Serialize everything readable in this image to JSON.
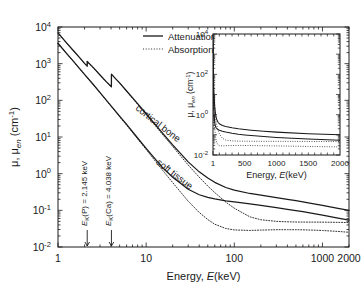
{
  "figure": {
    "background": "#ffffff",
    "line_color": "#1a1a1a"
  },
  "chart_data": {
    "type": "line",
    "title": "",
    "xlabel_prefix": "Energy, ",
    "xlabel_italic": "E",
    "xlabel_suffix": "(keV)",
    "ylabel": "μ, μ_en (cm⁻¹)",
    "xscale": "log",
    "yscale": "log",
    "xlim": [
      1,
      2000
    ],
    "ylim": [
      0.01,
      10000
    ],
    "xticks": [
      1,
      10,
      100,
      1000,
      2000
    ],
    "xticklabels": [
      "1",
      "10",
      "100",
      "1000",
      "2000"
    ],
    "yticks": [
      0.01,
      0.1,
      1,
      10,
      100,
      1000,
      10000
    ],
    "yticklabels": [
      "10⁻²",
      "10⁻¹",
      "10⁰",
      "10¹",
      "10²",
      "10³",
      "10⁴"
    ],
    "grid": false,
    "legend_position": "upper right",
    "legend": [
      {
        "label_prefix": "Attenuation, ",
        "symbol": "μ",
        "sub": "",
        "style": "solid"
      },
      {
        "label_prefix": "Absorption, ",
        "symbol": "μ",
        "sub": "en",
        "style": "dotted"
      }
    ],
    "annotations": [
      {
        "name": "k-edge-phosphorus",
        "text_prefix": "E",
        "text_sub": "K",
        "text_mid": "(P) = 2.145 ",
        "text_unit": "keV",
        "energy_keV": 2.145,
        "rotation": -90
      },
      {
        "name": "k-edge-calcium",
        "text_prefix": "E",
        "text_sub": "K",
        "text_mid": "(Ca) = 4.038 ",
        "text_unit": "keV",
        "energy_keV": 4.038,
        "rotation": -90
      }
    ],
    "curve_labels": [
      {
        "name": "cortical-bone",
        "text": "cortical bone",
        "rotation": 38
      },
      {
        "name": "soft-tissue",
        "text": "soft tissue",
        "rotation": 38
      }
    ],
    "series": [
      {
        "name": "cortical-bone-attenuation",
        "material": "cortical bone",
        "quantity": "attenuation",
        "style": "solid",
        "points": [
          [
            1.0,
            6900
          ],
          [
            1.25,
            3700
          ],
          [
            1.5,
            2250
          ],
          [
            1.75,
            1480
          ],
          [
            2.0,
            1020
          ],
          [
            2.144,
            860
          ],
          [
            2.146,
            1150
          ],
          [
            2.5,
            790
          ],
          [
            3.0,
            490
          ],
          [
            3.5,
            330
          ],
          [
            4.037,
            235
          ],
          [
            4.039,
            520
          ],
          [
            4.5,
            390
          ],
          [
            5.0,
            300
          ],
          [
            6.0,
            180
          ],
          [
            8.0,
            81
          ],
          [
            10.0,
            43
          ],
          [
            15.0,
            13.5
          ],
          [
            20.0,
            6.1
          ],
          [
            30.0,
            2.1
          ],
          [
            40.0,
            1.12
          ],
          [
            50.0,
            0.76
          ],
          [
            60.0,
            0.58
          ],
          [
            80.0,
            0.42
          ],
          [
            100.0,
            0.355
          ],
          [
            150.0,
            0.288
          ],
          [
            200.0,
            0.258
          ],
          [
            300.0,
            0.222
          ],
          [
            400.0,
            0.199
          ],
          [
            500.0,
            0.183
          ],
          [
            600.0,
            0.17
          ],
          [
            800.0,
            0.15
          ],
          [
            1000.0,
            0.136
          ],
          [
            1500.0,
            0.113
          ],
          [
            2000.0,
            0.1
          ]
        ]
      },
      {
        "name": "soft-tissue-attenuation",
        "material": "soft tissue",
        "quantity": "attenuation",
        "style": "solid",
        "points": [
          [
            1.0,
            3600
          ],
          [
            1.25,
            1900
          ],
          [
            1.5,
            1150
          ],
          [
            1.75,
            740
          ],
          [
            2.0,
            510
          ],
          [
            2.5,
            275
          ],
          [
            3.0,
            163
          ],
          [
            4.0,
            71
          ],
          [
            5.0,
            37
          ],
          [
            6.0,
            22
          ],
          [
            8.0,
            9.4
          ],
          [
            10.0,
            4.9
          ],
          [
            15.0,
            1.55
          ],
          [
            20.0,
            0.8
          ],
          [
            30.0,
            0.375
          ],
          [
            40.0,
            0.266
          ],
          [
            50.0,
            0.226
          ],
          [
            60.0,
            0.205
          ],
          [
            80.0,
            0.182
          ],
          [
            100.0,
            0.17
          ],
          [
            150.0,
            0.15
          ],
          [
            200.0,
            0.137
          ],
          [
            300.0,
            0.119
          ],
          [
            400.0,
            0.107
          ],
          [
            500.0,
            0.0985
          ],
          [
            600.0,
            0.092
          ],
          [
            800.0,
            0.0819
          ],
          [
            1000.0,
            0.0744
          ],
          [
            1500.0,
            0.0617
          ],
          [
            2000.0,
            0.0541
          ]
        ]
      },
      {
        "name": "cortical-bone-absorption",
        "material": "cortical bone",
        "quantity": "absorption",
        "style": "dotted",
        "points": [
          [
            1.0,
            6800
          ],
          [
            1.25,
            3650
          ],
          [
            1.5,
            2220
          ],
          [
            1.75,
            1460
          ],
          [
            2.0,
            1005
          ],
          [
            2.144,
            848
          ],
          [
            2.146,
            1135
          ],
          [
            2.5,
            780
          ],
          [
            3.0,
            482
          ],
          [
            3.5,
            325
          ],
          [
            4.037,
            230
          ],
          [
            4.039,
            512
          ],
          [
            4.5,
            383
          ],
          [
            5.0,
            294
          ],
          [
            6.0,
            176
          ],
          [
            8.0,
            78
          ],
          [
            10.0,
            41
          ],
          [
            15.0,
            12.5
          ],
          [
            20.0,
            5.5
          ],
          [
            30.0,
            1.72
          ],
          [
            40.0,
            0.8
          ],
          [
            50.0,
            0.46
          ],
          [
            60.0,
            0.305
          ],
          [
            80.0,
            0.168
          ],
          [
            100.0,
            0.114
          ],
          [
            150.0,
            0.0665
          ],
          [
            200.0,
            0.0553
          ],
          [
            300.0,
            0.05
          ],
          [
            400.0,
            0.0486
          ],
          [
            500.0,
            0.048
          ],
          [
            600.0,
            0.0478
          ],
          [
            800.0,
            0.0477
          ],
          [
            1000.0,
            0.0476
          ],
          [
            1500.0,
            0.047
          ],
          [
            2000.0,
            0.0463
          ]
        ]
      },
      {
        "name": "soft-tissue-absorption",
        "material": "soft tissue",
        "quantity": "absorption",
        "style": "dotted",
        "points": [
          [
            1.0,
            3550
          ],
          [
            1.25,
            1875
          ],
          [
            1.5,
            1135
          ],
          [
            1.75,
            730
          ],
          [
            2.0,
            503
          ],
          [
            2.5,
            270
          ],
          [
            3.0,
            160
          ],
          [
            4.0,
            69
          ],
          [
            5.0,
            35.5
          ],
          [
            6.0,
            21
          ],
          [
            8.0,
            8.9
          ],
          [
            10.0,
            4.55
          ],
          [
            15.0,
            1.33
          ],
          [
            20.0,
            0.57
          ],
          [
            30.0,
            0.177
          ],
          [
            40.0,
            0.0875
          ],
          [
            50.0,
            0.056
          ],
          [
            60.0,
            0.0418
          ],
          [
            80.0,
            0.032
          ],
          [
            100.0,
            0.0292
          ],
          [
            150.0,
            0.0283
          ],
          [
            200.0,
            0.0289
          ],
          [
            300.0,
            0.0296
          ],
          [
            400.0,
            0.0297
          ],
          [
            500.0,
            0.0296
          ],
          [
            600.0,
            0.0294
          ],
          [
            800.0,
            0.0288
          ],
          [
            1000.0,
            0.0282
          ],
          [
            1500.0,
            0.0266
          ],
          [
            2000.0,
            0.0252
          ]
        ]
      }
    ]
  },
  "inset": {
    "type": "line",
    "xlabel_prefix": "Energy, ",
    "xlabel_italic": "E",
    "xlabel_suffix": "(keV)",
    "ylabel": "μ, μ_en (cm⁻¹)",
    "xscale": "linear",
    "yscale": "log",
    "xlim": [
      1,
      2000
    ],
    "ylim": [
      0.01,
      10000
    ],
    "xticks": [
      1,
      500,
      1000,
      1500,
      2000
    ],
    "xticklabels": [
      "1",
      "500",
      "1000",
      "1500",
      "2000"
    ],
    "yticks": [
      0.01,
      1,
      100,
      10000
    ],
    "yticklabels": [
      "10⁻²",
      "10⁰",
      "10²",
      "10⁴"
    ],
    "grid": false,
    "series": [
      {
        "name": "cortical-bone-attenuation",
        "style": "solid",
        "source": "chart_data.series.0"
      },
      {
        "name": "soft-tissue-attenuation",
        "style": "solid",
        "source": "chart_data.series.1"
      },
      {
        "name": "cortical-bone-absorption",
        "style": "dotted",
        "source": "chart_data.series.2"
      },
      {
        "name": "soft-tissue-absorption",
        "style": "dotted",
        "source": "chart_data.series.3"
      }
    ]
  }
}
